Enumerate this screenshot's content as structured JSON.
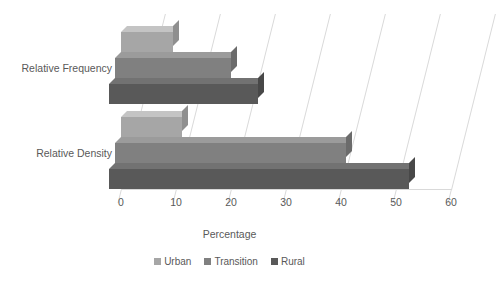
{
  "chart_data": {
    "type": "bar",
    "orientation": "horizontal",
    "stacked": false,
    "three_d": true,
    "title": "",
    "xlabel": "Percentage",
    "ylabel": "",
    "xlim": [
      0,
      60
    ],
    "xticks": [
      0,
      10,
      20,
      30,
      40,
      50,
      60
    ],
    "grid": true,
    "legend_position": "bottom",
    "categories": [
      "Relative Frequency",
      "Relative Density"
    ],
    "series": [
      {
        "name": "Urban",
        "color": "#a6a6a6",
        "values": [
          9.5,
          11
        ]
      },
      {
        "name": "Transition",
        "color": "#808080",
        "values": [
          21,
          42
        ]
      },
      {
        "name": "Rural",
        "color": "#595959",
        "values": [
          27,
          54.5
        ]
      }
    ]
  },
  "axis": {
    "tick_labels": [
      "0",
      "10",
      "20",
      "30",
      "40",
      "50",
      "60"
    ],
    "title": "Percentage"
  },
  "categories": {
    "frequency_label": "Relative Frequency",
    "density_label": "Relative Density"
  },
  "legend": {
    "items": [
      {
        "label": "Urban"
      },
      {
        "label": "Transition"
      },
      {
        "label": "Rural"
      }
    ]
  },
  "colors": {
    "urban": "#a6a6a6",
    "urban_top": "#c4c4c4",
    "urban_side": "#8f8f8f",
    "transition": "#808080",
    "transition_top": "#9b9b9b",
    "transition_side": "#6b6b6b",
    "rural": "#595959",
    "rural_top": "#727272",
    "rural_side": "#484848",
    "gridline": "#d9d9d9",
    "text": "#595959",
    "background": "#ffffff"
  }
}
